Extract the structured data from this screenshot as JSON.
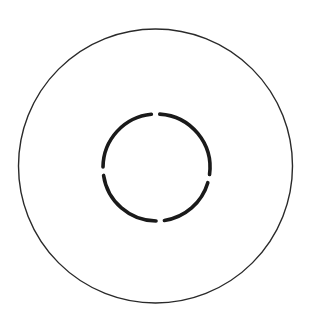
{
  "diagram": {
    "background": "#ffffff",
    "outer_circle": {
      "cx": 155.5,
      "cy": 166,
      "r": 137,
      "stroke": "#2a2a2a",
      "stroke_width": 1.4
    },
    "inner_circle": {
      "cx": 156.5,
      "cy": 167.5,
      "r": 53.5,
      "stroke": "#1a1a1a",
      "stroke_width": 3.6,
      "gap_angles_deg": [
        12,
        86,
        176,
        269
      ],
      "gap_width_deg": 9
    }
  }
}
